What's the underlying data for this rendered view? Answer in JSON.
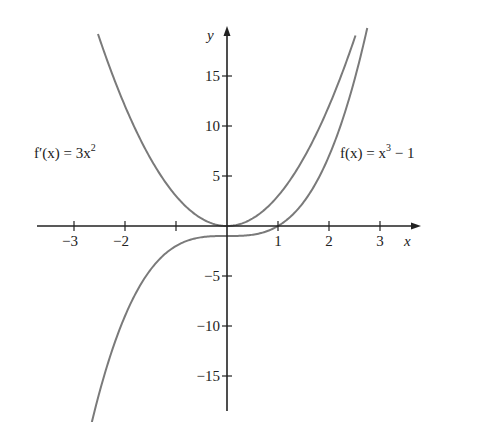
{
  "chart_data": {
    "type": "line",
    "title": "",
    "xlabel": "x",
    "ylabel": "y",
    "xlim": [
      -3.7,
      3.8
    ],
    "ylim": [
      -18.5,
      19.5
    ],
    "grid": false,
    "x_ticks": [
      -3,
      -2,
      -1,
      1,
      2,
      3
    ],
    "x_tick_labels": [
      "−3",
      "−2",
      "",
      "1",
      "2",
      "3"
    ],
    "y_ticks": [
      -15,
      -10,
      -5,
      5,
      10,
      15
    ],
    "y_tick_labels": [
      "−15",
      "−10",
      "−5",
      "5",
      "10",
      "15"
    ],
    "series": [
      {
        "name": "f'(x) = 3x²",
        "expression": "3x^2",
        "x_range": [
          -2.53,
          2.52
        ],
        "x": [
          -2.5,
          -2,
          -1.5,
          -1,
          -0.5,
          0,
          0.5,
          1,
          1.5,
          2,
          2.5
        ],
        "values": [
          18.75,
          12,
          6.75,
          3,
          0.75,
          0,
          0.75,
          3,
          6.75,
          12,
          18.75
        ]
      },
      {
        "name": "f(x) = x³ − 1",
        "expression": "x^3 - 1",
        "x_range": [
          -2.65,
          2.75
        ],
        "x": [
          -2.5,
          -2,
          -1.5,
          -1,
          -0.5,
          0,
          0.5,
          1,
          1.5,
          2,
          2.5
        ],
        "values": [
          -16.625,
          -9,
          -4.375,
          -2,
          -1.125,
          -1,
          -0.875,
          0,
          2.375,
          7,
          14.625
        ]
      }
    ],
    "annotations": [
      {
        "text": "f′(x) = 3x²",
        "near": "left branch of 3x²"
      },
      {
        "text": "f(x) = x³ − 1",
        "near": "right branch of x³ − 1"
      }
    ]
  },
  "labels": {
    "x_axis": "x",
    "y_axis": "y",
    "fprime_name": "f′(x) = 3x",
    "fprime_exp": "2",
    "f_name": "f(x) = x",
    "f_exp": "3",
    "f_tail": " − 1"
  },
  "colors": {
    "axis": "#222222",
    "curve": "#7a7a7a",
    "background": "#ffffff"
  }
}
